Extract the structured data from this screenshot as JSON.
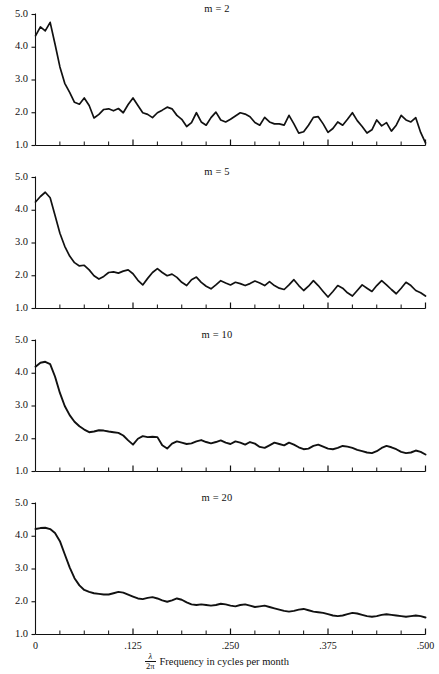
{
  "figure": {
    "panel_count": 4,
    "x_axis": {
      "title_fraction_numerator": "λ",
      "title_fraction_denominator": "2π",
      "title_text": "Frequency in cycles per month",
      "ticks": [
        "0",
        ".125",
        ".250",
        ".375",
        ".500"
      ],
      "tick_values": [
        0,
        0.125,
        0.25,
        0.375,
        0.5
      ],
      "minor_tick_count": 16
    },
    "y_axis": {
      "ticks": [
        "5.0",
        "4.0",
        "3.0",
        "2.0",
        "1.0"
      ],
      "tick_values": [
        5.0,
        4.0,
        3.0,
        2.0,
        1.0
      ]
    },
    "colors": {
      "line": "#111111",
      "axis": "#111111",
      "background": "#ffffff"
    }
  },
  "chart_data": [
    {
      "type": "line",
      "title": "m = 2",
      "series_label": "m = 2",
      "m": 2,
      "xlabel": "λ/2π Frequency in cycles per month",
      "ylabel": "",
      "xlim": [
        0.0,
        0.5
      ],
      "ylim": [
        1.0,
        5.0
      ],
      "grid": false,
      "legend": "none",
      "x": [
        0.0,
        0.0063,
        0.0125,
        0.0188,
        0.025,
        0.0313,
        0.0375,
        0.0438,
        0.05,
        0.0563,
        0.0625,
        0.0688,
        0.075,
        0.0813,
        0.0875,
        0.0938,
        0.1,
        0.1063,
        0.1125,
        0.1188,
        0.125,
        0.1313,
        0.1375,
        0.1438,
        0.15,
        0.1563,
        0.1625,
        0.1688,
        0.175,
        0.1813,
        0.1875,
        0.1938,
        0.2,
        0.2063,
        0.2125,
        0.2188,
        0.225,
        0.2313,
        0.2375,
        0.2438,
        0.25,
        0.2563,
        0.2625,
        0.2688,
        0.275,
        0.2813,
        0.2875,
        0.2938,
        0.3,
        0.3063,
        0.3125,
        0.3188,
        0.325,
        0.3313,
        0.3375,
        0.3438,
        0.35,
        0.3563,
        0.3625,
        0.3688,
        0.375,
        0.3813,
        0.3875,
        0.3938,
        0.4,
        0.4063,
        0.4125,
        0.4188,
        0.425,
        0.4313,
        0.4375,
        0.4438,
        0.45,
        0.4563,
        0.4625,
        0.4688,
        0.475,
        0.4813,
        0.4875,
        0.4938,
        0.5
      ],
      "y": [
        4.35,
        4.62,
        4.5,
        4.76,
        4.1,
        3.4,
        2.9,
        2.62,
        2.32,
        2.26,
        2.45,
        2.22,
        1.84,
        1.95,
        2.1,
        2.12,
        2.06,
        2.13,
        2.0,
        2.25,
        2.45,
        2.22,
        2.0,
        1.95,
        1.85,
        2.0,
        2.08,
        2.17,
        2.12,
        1.92,
        1.8,
        1.58,
        1.7,
        2.0,
        1.72,
        1.62,
        1.85,
        2.02,
        1.78,
        1.72,
        1.8,
        1.9,
        2.0,
        1.96,
        1.88,
        1.7,
        1.62,
        1.86,
        1.72,
        1.66,
        1.66,
        1.62,
        1.92,
        1.66,
        1.38,
        1.42,
        1.62,
        1.86,
        1.88,
        1.66,
        1.4,
        1.52,
        1.72,
        1.62,
        1.8,
        2.0,
        1.76,
        1.58,
        1.38,
        1.48,
        1.78,
        1.6,
        1.7,
        1.44,
        1.62,
        1.92,
        1.78,
        1.72,
        1.85,
        1.4,
        1.08
      ]
    },
    {
      "type": "line",
      "title": "m = 5",
      "series_label": "m = 5",
      "m": 5,
      "xlabel": "λ/2π Frequency in cycles per month",
      "ylabel": "",
      "xlim": [
        0.0,
        0.5
      ],
      "ylim": [
        1.0,
        5.0
      ],
      "grid": false,
      "legend": "none",
      "x": [
        0.0,
        0.0063,
        0.0125,
        0.0188,
        0.025,
        0.0313,
        0.0375,
        0.0438,
        0.05,
        0.0563,
        0.0625,
        0.0688,
        0.075,
        0.0813,
        0.0875,
        0.0938,
        0.1,
        0.1063,
        0.1125,
        0.1188,
        0.125,
        0.1313,
        0.1375,
        0.1438,
        0.15,
        0.1563,
        0.1625,
        0.1688,
        0.175,
        0.1813,
        0.1875,
        0.1938,
        0.2,
        0.2063,
        0.2125,
        0.2188,
        0.225,
        0.2313,
        0.2375,
        0.2438,
        0.25,
        0.2563,
        0.2625,
        0.2688,
        0.275,
        0.2813,
        0.2875,
        0.2938,
        0.3,
        0.3063,
        0.3125,
        0.3188,
        0.325,
        0.3313,
        0.3375,
        0.3438,
        0.35,
        0.3563,
        0.3625,
        0.3688,
        0.375,
        0.3813,
        0.3875,
        0.3938,
        0.4,
        0.4063,
        0.4125,
        0.4188,
        0.425,
        0.4313,
        0.4375,
        0.4438,
        0.45,
        0.4563,
        0.4625,
        0.4688,
        0.475,
        0.4813,
        0.4875,
        0.4938,
        0.5
      ],
      "y": [
        4.25,
        4.42,
        4.55,
        4.38,
        3.85,
        3.3,
        2.9,
        2.6,
        2.4,
        2.3,
        2.32,
        2.18,
        2.0,
        1.9,
        1.98,
        2.1,
        2.12,
        2.08,
        2.14,
        2.18,
        2.06,
        1.86,
        1.72,
        1.92,
        2.1,
        2.22,
        2.1,
        2.0,
        2.05,
        1.95,
        1.8,
        1.7,
        1.88,
        1.96,
        1.8,
        1.68,
        1.6,
        1.72,
        1.85,
        1.78,
        1.72,
        1.8,
        1.76,
        1.7,
        1.76,
        1.84,
        1.78,
        1.7,
        1.82,
        1.7,
        1.62,
        1.58,
        1.72,
        1.88,
        1.7,
        1.55,
        1.68,
        1.85,
        1.7,
        1.52,
        1.35,
        1.52,
        1.7,
        1.62,
        1.48,
        1.38,
        1.55,
        1.72,
        1.62,
        1.52,
        1.7,
        1.85,
        1.72,
        1.58,
        1.45,
        1.62,
        1.8,
        1.7,
        1.55,
        1.48,
        1.38
      ]
    },
    {
      "type": "line",
      "title": "m = 10",
      "series_label": "m = 10",
      "m": 10,
      "xlabel": "λ/2π Frequency in cycles per month",
      "ylabel": "",
      "xlim": [
        0.0,
        0.5
      ],
      "ylim": [
        1.0,
        5.0
      ],
      "grid": false,
      "legend": "none",
      "x": [
        0.0,
        0.0063,
        0.0125,
        0.0188,
        0.025,
        0.0313,
        0.0375,
        0.0438,
        0.05,
        0.0563,
        0.0625,
        0.0688,
        0.075,
        0.0813,
        0.0875,
        0.0938,
        0.1,
        0.1063,
        0.1125,
        0.1188,
        0.125,
        0.1313,
        0.1375,
        0.1438,
        0.15,
        0.1563,
        0.1625,
        0.1688,
        0.175,
        0.1813,
        0.1875,
        0.1938,
        0.2,
        0.2063,
        0.2125,
        0.2188,
        0.225,
        0.2313,
        0.2375,
        0.2438,
        0.25,
        0.2563,
        0.2625,
        0.2688,
        0.275,
        0.2813,
        0.2875,
        0.2938,
        0.3,
        0.3063,
        0.3125,
        0.3188,
        0.325,
        0.3313,
        0.3375,
        0.3438,
        0.35,
        0.3563,
        0.3625,
        0.3688,
        0.375,
        0.3813,
        0.3875,
        0.3938,
        0.4,
        0.4063,
        0.4125,
        0.4188,
        0.425,
        0.4313,
        0.4375,
        0.4438,
        0.45,
        0.4563,
        0.4625,
        0.4688,
        0.475,
        0.4813,
        0.4875,
        0.4938,
        0.5
      ],
      "y": [
        4.2,
        4.32,
        4.35,
        4.28,
        3.9,
        3.4,
        3.0,
        2.72,
        2.52,
        2.38,
        2.28,
        2.2,
        2.22,
        2.26,
        2.25,
        2.22,
        2.2,
        2.18,
        2.1,
        1.95,
        1.82,
        2.0,
        2.08,
        2.05,
        2.06,
        2.05,
        1.8,
        1.7,
        1.85,
        1.92,
        1.88,
        1.84,
        1.86,
        1.92,
        1.96,
        1.9,
        1.86,
        1.9,
        1.95,
        1.88,
        1.84,
        1.92,
        1.88,
        1.82,
        1.9,
        1.85,
        1.75,
        1.72,
        1.8,
        1.88,
        1.84,
        1.8,
        1.88,
        1.82,
        1.74,
        1.68,
        1.7,
        1.78,
        1.82,
        1.76,
        1.7,
        1.68,
        1.72,
        1.78,
        1.76,
        1.72,
        1.66,
        1.62,
        1.58,
        1.56,
        1.62,
        1.72,
        1.78,
        1.74,
        1.68,
        1.6,
        1.56,
        1.58,
        1.64,
        1.6,
        1.52
      ]
    },
    {
      "type": "line",
      "title": "m = 20",
      "series_label": "m = 20",
      "m": 20,
      "xlabel": "λ/2π Frequency in cycles per month",
      "ylabel": "",
      "xlim": [
        0.0,
        0.5
      ],
      "ylim": [
        1.0,
        5.0
      ],
      "grid": false,
      "legend": "none",
      "x": [
        0.0,
        0.0063,
        0.0125,
        0.0188,
        0.025,
        0.0313,
        0.0375,
        0.0438,
        0.05,
        0.0563,
        0.0625,
        0.0688,
        0.075,
        0.0813,
        0.0875,
        0.0938,
        0.1,
        0.1063,
        0.1125,
        0.1188,
        0.125,
        0.1313,
        0.1375,
        0.1438,
        0.15,
        0.1563,
        0.1625,
        0.1688,
        0.175,
        0.1813,
        0.1875,
        0.1938,
        0.2,
        0.2063,
        0.2125,
        0.2188,
        0.225,
        0.2313,
        0.2375,
        0.2438,
        0.25,
        0.2563,
        0.2625,
        0.2688,
        0.275,
        0.2813,
        0.2875,
        0.2938,
        0.3,
        0.3063,
        0.3125,
        0.3188,
        0.325,
        0.3313,
        0.3375,
        0.3438,
        0.35,
        0.3563,
        0.3625,
        0.3688,
        0.375,
        0.3813,
        0.3875,
        0.3938,
        0.4,
        0.4063,
        0.4125,
        0.4188,
        0.425,
        0.4313,
        0.4375,
        0.4438,
        0.45,
        0.4563,
        0.4625,
        0.4688,
        0.475,
        0.4813,
        0.4875,
        0.4938,
        0.5
      ],
      "y": [
        4.22,
        4.25,
        4.26,
        4.22,
        4.1,
        3.85,
        3.45,
        3.05,
        2.72,
        2.5,
        2.36,
        2.3,
        2.26,
        2.24,
        2.22,
        2.22,
        2.26,
        2.3,
        2.28,
        2.22,
        2.16,
        2.1,
        2.08,
        2.12,
        2.14,
        2.1,
        2.04,
        2.0,
        2.04,
        2.1,
        2.06,
        1.98,
        1.92,
        1.9,
        1.92,
        1.9,
        1.88,
        1.9,
        1.94,
        1.92,
        1.88,
        1.86,
        1.9,
        1.92,
        1.88,
        1.84,
        1.86,
        1.88,
        1.84,
        1.8,
        1.76,
        1.72,
        1.7,
        1.72,
        1.76,
        1.78,
        1.74,
        1.7,
        1.68,
        1.66,
        1.62,
        1.58,
        1.56,
        1.58,
        1.62,
        1.66,
        1.64,
        1.6,
        1.56,
        1.54,
        1.56,
        1.6,
        1.62,
        1.6,
        1.58,
        1.56,
        1.54,
        1.56,
        1.58,
        1.56,
        1.52
      ]
    }
  ]
}
